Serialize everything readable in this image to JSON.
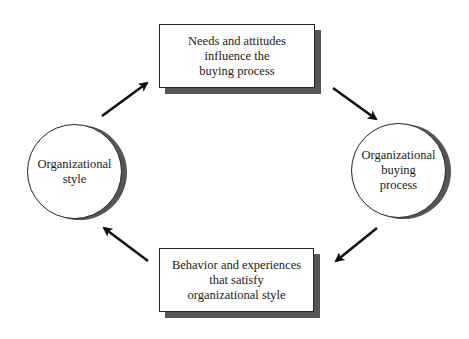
{
  "diagram": {
    "type": "cycle",
    "nodes": {
      "top_box": {
        "shape": "rectangle",
        "label": "Needs and attitudes\ninfluence the\nbuying process"
      },
      "right_circle": {
        "shape": "circle",
        "label": "Organizational\nbuying\nprocess"
      },
      "bottom_box": {
        "shape": "rectangle",
        "label": "Behavior and experiences\nthat satisfy\norganizational style"
      },
      "left_circle": {
        "shape": "circle",
        "label": "Organizational\nstyle"
      }
    },
    "edges": [
      {
        "from": "left_circle",
        "to": "top_box",
        "icon": "arrow-up-right"
      },
      {
        "from": "top_box",
        "to": "right_circle",
        "icon": "arrow-down-right"
      },
      {
        "from": "right_circle",
        "to": "bottom_box",
        "icon": "arrow-down-left"
      },
      {
        "from": "bottom_box",
        "to": "left_circle",
        "icon": "arrow-up-left"
      }
    ],
    "colors": {
      "stroke": "#222222",
      "shadow": "#555555",
      "fill": "#ffffff"
    }
  }
}
